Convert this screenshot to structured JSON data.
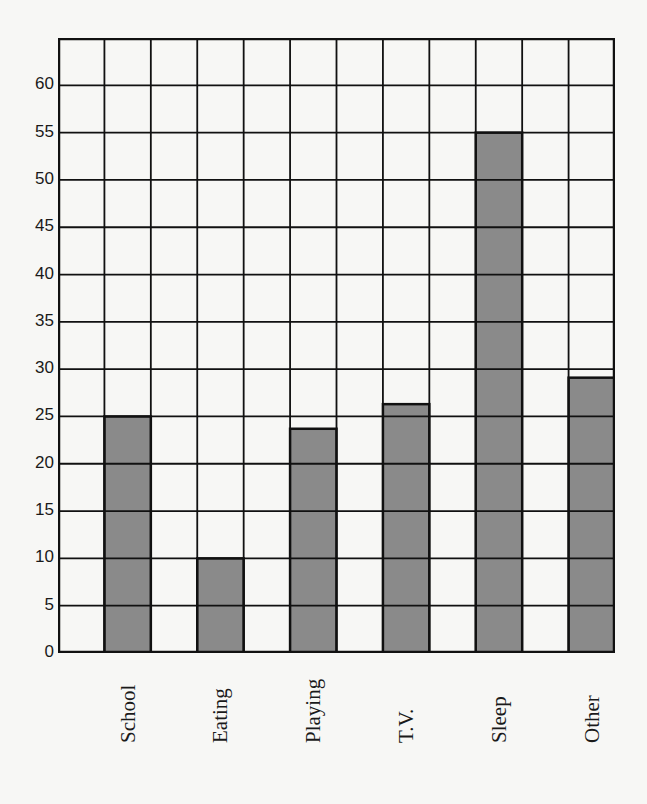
{
  "chart_data": {
    "type": "bar",
    "title": "",
    "xlabel": "",
    "ylabel": "",
    "categories": [
      "School",
      "Eating",
      "Playing",
      "T.V.",
      "Sleep",
      "Other"
    ],
    "values": [
      25,
      10,
      23.7,
      26.3,
      55,
      29.1
    ],
    "ylim": [
      0,
      65
    ],
    "yticks": [
      0,
      5,
      10,
      15,
      20,
      25,
      30,
      35,
      40,
      45,
      50,
      55,
      60
    ],
    "grid": true,
    "grid_columns": 12,
    "bar_fill": "#8a8a8a",
    "grid_color": "#111111",
    "background": "#f7f7f5"
  }
}
